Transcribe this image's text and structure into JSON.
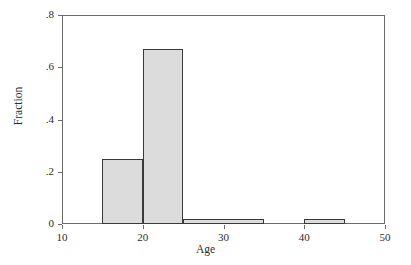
{
  "chart_data": {
    "type": "bar",
    "title": "",
    "subtitle": "",
    "xlabel": "Age",
    "ylabel": "Fraction",
    "xlim": [
      10,
      50
    ],
    "ylim": [
      0,
      0.8
    ],
    "grid": false,
    "legend": null,
    "xticks": [
      {
        "value": 10,
        "label": "10"
      },
      {
        "value": 20,
        "label": "20"
      },
      {
        "value": 30,
        "label": "30"
      },
      {
        "value": 40,
        "label": "40"
      },
      {
        "value": 50,
        "label": "50"
      }
    ],
    "yticks": [
      {
        "value": 0,
        "label": "0"
      },
      {
        "value": 0.2,
        "label": ".2"
      },
      {
        "value": 0.4,
        "label": ".4"
      },
      {
        "value": 0.6,
        "label": ".6"
      },
      {
        "value": 0.8,
        "label": ".8"
      }
    ],
    "bins": [
      {
        "x0": 15,
        "x1": 20,
        "value": 0.25
      },
      {
        "x0": 20,
        "x1": 25,
        "value": 0.67
      },
      {
        "x0": 25,
        "x1": 35,
        "value": 0.02
      },
      {
        "x0": 40,
        "x1": 45,
        "value": 0.02
      }
    ],
    "categories": [
      "15-20",
      "20-25",
      "25-35",
      "40-45"
    ],
    "values": [
      0.25,
      0.67,
      0.02,
      0.02
    ],
    "colors": {
      "bar_fill": "#dcdcdc",
      "bar_border": "#3a3a3a",
      "axis": "#6b6b6b",
      "text": "#2b2b2b",
      "background": "#ffffff"
    }
  }
}
